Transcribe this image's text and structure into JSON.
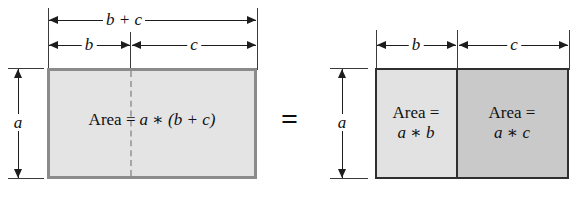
{
  "figure": {
    "relation_symbol": "=",
    "colors": {
      "fill_light": "#e2e2e2",
      "fill_dark": "#c9c9c9",
      "stroke": "#2f2f2f",
      "dashed": "#a6a6a6",
      "background": "#ffffff"
    },
    "left": {
      "name": "single-rectangle",
      "top_dimensions": [
        {
          "id": "b-plus-c",
          "label": "b + c",
          "spans": "full-width"
        },
        {
          "id": "b",
          "label": "b",
          "spans": "left-part"
        },
        {
          "id": "c",
          "label": "c",
          "spans": "right-part"
        }
      ],
      "side_dimension": {
        "id": "a",
        "label": "a"
      },
      "area_text": {
        "prefix": "Area =",
        "expression": "a ∗ (b + c)",
        "expression_parts": [
          "a",
          "∗",
          "(b",
          "+",
          "c)"
        ]
      }
    },
    "right": {
      "name": "split-rectangle",
      "top_dimensions": [
        {
          "id": "b",
          "label": "b",
          "spans": "left-part"
        },
        {
          "id": "c",
          "label": "c",
          "spans": "right-part"
        }
      ],
      "side_dimension": {
        "id": "a",
        "label": "a"
      },
      "cells": [
        {
          "id": "cell-b",
          "area_text": {
            "prefix": "Area =",
            "expression": "a ∗ b"
          },
          "fill": "#e2e2e2"
        },
        {
          "id": "cell-c",
          "area_text": {
            "prefix": "Area =",
            "expression": "a ∗ c"
          },
          "fill": "#c9c9c9"
        }
      ]
    }
  }
}
